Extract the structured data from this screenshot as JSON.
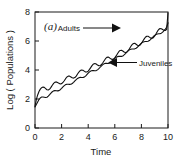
{
  "figure": {
    "panel_label": "(a)",
    "background": "#ffffff",
    "line_color": "#111111"
  },
  "chart_data": {
    "type": "line",
    "title": "",
    "panel": "(a)",
    "xlabel": "Time",
    "ylabel": "Log ( Populations )",
    "xlim": [
      0,
      10
    ],
    "ylim": [
      0,
      8
    ],
    "xticks": [
      0,
      2,
      4,
      6,
      8,
      10
    ],
    "yticks": [
      0,
      2,
      4,
      6,
      8
    ],
    "xtick_labels": [
      "0",
      "2",
      "4",
      "6",
      "8",
      "10"
    ],
    "ytick_labels": [
      "0",
      "2",
      "4",
      "6",
      "8"
    ],
    "grid": false,
    "legend": "annotations",
    "annotations": [
      {
        "text": "Adults",
        "arrow": "right",
        "points_to_series": "Adults",
        "x": 4.6,
        "y": 7.0
      },
      {
        "text": "Juveniles",
        "arrow": "left",
        "points_to_series": "Juveniles",
        "x": 7.6,
        "y": 4.5
      }
    ],
    "series": [
      {
        "name": "Adults",
        "description": "Upper oscillating curve with damped-amplitude cycles superimposed on a rising log trend",
        "x": [
          0.0,
          0.1,
          0.2,
          0.3,
          0.4,
          0.5,
          0.6,
          0.7,
          0.8,
          0.9,
          1.0,
          1.1,
          1.2,
          1.3,
          1.4,
          1.5,
          1.6,
          1.7,
          1.8,
          1.9,
          2.0,
          2.1,
          2.2,
          2.3,
          2.4,
          2.5,
          2.6,
          2.7,
          2.8,
          2.9,
          3.0,
          3.1,
          3.2,
          3.3,
          3.4,
          3.5,
          3.6,
          3.7,
          3.8,
          3.9,
          4.0,
          4.1,
          4.2,
          4.3,
          4.4,
          4.5,
          4.6,
          4.7,
          4.8,
          4.9,
          5.0,
          5.1,
          5.2,
          5.3,
          5.4,
          5.5,
          5.6,
          5.7,
          5.8,
          5.9,
          6.0,
          6.1,
          6.2,
          6.3,
          6.4,
          6.5,
          6.6,
          6.7,
          6.8,
          6.9,
          7.0,
          7.1,
          7.2,
          7.3,
          7.4,
          7.5,
          7.6,
          7.7,
          7.8,
          7.9,
          8.0,
          8.1,
          8.2,
          8.3,
          8.4,
          8.5,
          8.6,
          8.7,
          8.8,
          8.9,
          9.0,
          9.1,
          9.2,
          9.3,
          9.4,
          9.5,
          9.6,
          9.7,
          9.8,
          9.9,
          10.0
        ],
        "y": [
          1.5,
          1.95,
          2.28,
          2.52,
          2.68,
          2.78,
          2.82,
          2.8,
          2.72,
          2.64,
          2.62,
          2.68,
          2.8,
          2.95,
          3.08,
          3.16,
          3.18,
          3.14,
          3.08,
          3.04,
          3.06,
          3.14,
          3.26,
          3.4,
          3.52,
          3.58,
          3.58,
          3.52,
          3.46,
          3.44,
          3.48,
          3.58,
          3.72,
          3.86,
          3.96,
          4.0,
          3.98,
          3.92,
          3.86,
          3.86,
          3.92,
          4.04,
          4.18,
          4.32,
          4.42,
          4.45,
          4.41,
          4.34,
          4.29,
          4.3,
          4.38,
          4.5,
          4.64,
          4.78,
          4.87,
          4.89,
          4.84,
          4.77,
          4.73,
          4.75,
          4.84,
          4.97,
          5.12,
          5.26,
          5.35,
          5.36,
          5.31,
          5.24,
          5.2,
          5.23,
          5.33,
          5.47,
          5.62,
          5.75,
          5.83,
          5.84,
          5.78,
          5.71,
          5.68,
          5.72,
          5.83,
          5.98,
          6.13,
          6.26,
          6.33,
          6.33,
          6.27,
          6.2,
          6.18,
          6.23,
          6.35,
          6.5,
          6.66,
          6.79,
          6.86,
          6.85,
          6.79,
          6.73,
          6.72,
          6.8,
          7.95
        ]
      },
      {
        "name": "Juveniles",
        "description": "Lower, smoother curve rising steadily with small ripples, converging toward the adult curve at t=10",
        "x": [
          0.0,
          0.1,
          0.2,
          0.3,
          0.4,
          0.5,
          0.6,
          0.7,
          0.8,
          0.9,
          1.0,
          1.1,
          1.2,
          1.3,
          1.4,
          1.5,
          1.6,
          1.7,
          1.8,
          1.9,
          2.0,
          2.1,
          2.2,
          2.3,
          2.4,
          2.5,
          2.6,
          2.7,
          2.8,
          2.9,
          3.0,
          3.1,
          3.2,
          3.3,
          3.4,
          3.5,
          3.6,
          3.7,
          3.8,
          3.9,
          4.0,
          4.1,
          4.2,
          4.3,
          4.4,
          4.5,
          4.6,
          4.7,
          4.8,
          4.9,
          5.0,
          5.1,
          5.2,
          5.3,
          5.4,
          5.5,
          5.6,
          5.7,
          5.8,
          5.9,
          6.0,
          6.1,
          6.2,
          6.3,
          6.4,
          6.5,
          6.6,
          6.7,
          6.8,
          6.9,
          7.0,
          7.1,
          7.2,
          7.3,
          7.4,
          7.5,
          7.6,
          7.7,
          7.8,
          7.9,
          8.0,
          8.1,
          8.2,
          8.3,
          8.4,
          8.5,
          8.6,
          8.7,
          8.8,
          8.9,
          9.0,
          9.1,
          9.2,
          9.3,
          9.4,
          9.5,
          9.6,
          9.7,
          9.8,
          9.9,
          10.0
        ],
        "y": [
          1.45,
          1.62,
          1.8,
          1.96,
          2.08,
          2.14,
          2.14,
          2.12,
          2.1,
          2.12,
          2.2,
          2.3,
          2.41,
          2.5,
          2.56,
          2.58,
          2.57,
          2.56,
          2.58,
          2.64,
          2.73,
          2.83,
          2.92,
          2.99,
          3.02,
          3.02,
          3.01,
          3.02,
          3.07,
          3.15,
          3.25,
          3.34,
          3.42,
          3.47,
          3.49,
          3.48,
          3.48,
          3.51,
          3.58,
          3.68,
          3.78,
          3.87,
          3.93,
          3.96,
          3.96,
          3.95,
          3.96,
          4.01,
          4.09,
          4.19,
          4.29,
          4.37,
          4.43,
          4.46,
          4.46,
          4.45,
          4.47,
          4.53,
          4.62,
          4.72,
          4.81,
          4.88,
          4.92,
          4.94,
          4.94,
          4.94,
          4.97,
          5.04,
          5.13,
          5.23,
          5.32,
          5.39,
          5.43,
          5.45,
          5.45,
          5.46,
          5.5,
          5.57,
          5.67,
          5.77,
          5.86,
          5.92,
          5.95,
          5.97,
          5.97,
          5.98,
          6.03,
          6.11,
          6.21,
          6.31,
          6.39,
          6.45,
          6.48,
          6.5,
          6.51,
          6.54,
          6.61,
          6.71,
          6.82,
          6.95,
          7.25
        ]
      }
    ]
  }
}
